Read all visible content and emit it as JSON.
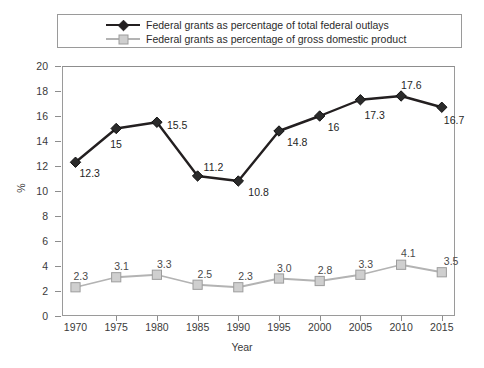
{
  "legend": {
    "entries": [
      {
        "label": "Federal grants as percentage of total federal outlays",
        "marker": "diamond-marker-icon",
        "color": "#231f20"
      },
      {
        "label": "Federal grants as percentage of gross domestic product",
        "marker": "square-marker-icon",
        "color": "#b3b3b3"
      }
    ]
  },
  "axes": {
    "xlabel": "Year",
    "ylabel": "%"
  },
  "chart_data": {
    "type": "line",
    "title": "",
    "xlabel": "Year",
    "ylabel": "%",
    "categories": [
      "1970",
      "1975",
      "1980",
      "1985",
      "1990",
      "1995",
      "2000",
      "2005",
      "2010",
      "2015"
    ],
    "x": [
      1970,
      1975,
      1980,
      1985,
      1990,
      1995,
      2000,
      2005,
      2010,
      2015
    ],
    "ylim": [
      0,
      20
    ],
    "yticks": [
      "0",
      "2",
      "4",
      "6",
      "8",
      "10",
      "12",
      "14",
      "16",
      "18",
      "20"
    ],
    "grid": false,
    "legend_position": "top",
    "series": [
      {
        "name": "Federal grants as percentage of total federal outlays",
        "color": "#231f20",
        "marker": "diamond",
        "values": [
          12.3,
          15,
          15.5,
          11.2,
          10.8,
          14.8,
          16,
          17.3,
          17.6,
          16.7
        ],
        "labels": [
          "12.3",
          "15",
          "15.5",
          "11.2",
          "10.8",
          "14.8",
          "16",
          "17.3",
          "17.6",
          "16.7"
        ]
      },
      {
        "name": "Federal grants as percentage of gross domestic product",
        "color": "#b3b3b3",
        "marker": "square",
        "values": [
          2.3,
          3.1,
          3.3,
          2.5,
          2.3,
          3.0,
          2.8,
          3.3,
          4.1,
          3.5
        ],
        "labels": [
          "2.3",
          "3.1",
          "3.3",
          "2.5",
          "2.3",
          "3.0",
          "2.8",
          "3.3",
          "4.1",
          "3.5"
        ]
      }
    ]
  }
}
